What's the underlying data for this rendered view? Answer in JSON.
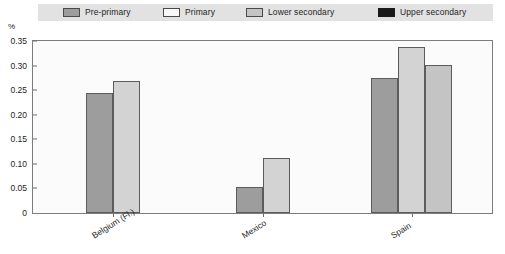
{
  "legend": {
    "items": [
      {
        "label": "Pre-primary",
        "color": "#9d9d9d",
        "key": "pre_primary"
      },
      {
        "label": "Primary",
        "color": "#f4f4f4",
        "key": "primary"
      },
      {
        "label": "Lower secondary",
        "color": "#c4c4c4",
        "key": "lower_secondary"
      },
      {
        "label": "Upper secondary",
        "color": "#1a1a1a",
        "key": "upper_secondary"
      }
    ]
  },
  "axis": {
    "y_unit": "%",
    "ticks": [
      "0.35",
      "0.30",
      "0.25",
      "0.20",
      "0.15",
      "0.10",
      "0.05",
      "0"
    ]
  },
  "chart_data": {
    "type": "bar",
    "title": "",
    "xlabel": "",
    "ylabel": "%",
    "ylim": [
      0,
      0.35
    ],
    "grid": false,
    "legend_position": "top",
    "categories": [
      "Belgium (Fl.)",
      "Mexico",
      "Spain"
    ],
    "series": [
      {
        "name": "Pre-primary",
        "color": "#9d9d9d",
        "values": [
          0.245,
          0.053,
          0.274
        ]
      },
      {
        "name": "Primary",
        "color": "#d3d3d3",
        "values": [
          0.268,
          0.111,
          0.338
        ]
      },
      {
        "name": "Lower secondary",
        "color": "#c4c4c4",
        "values": [
          null,
          null,
          0.302
        ]
      },
      {
        "name": "Upper secondary",
        "color": "#1a1a1a",
        "values": [
          null,
          null,
          null
        ]
      }
    ]
  }
}
